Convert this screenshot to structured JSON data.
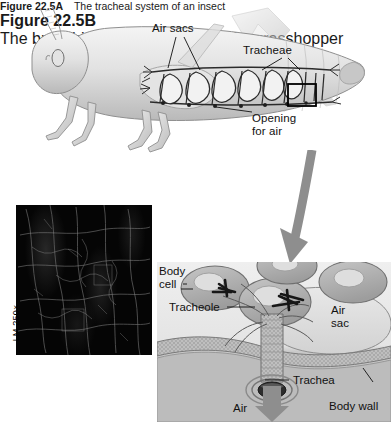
{
  "figure_a": {
    "labels": {
      "air_sacs": "Air sacs",
      "tracheae": "Tracheae",
      "opening_for_air": "Opening\nfor air"
    },
    "caption_title": "Figure 22.5A",
    "caption_text": "The tracheal system of an insect"
  },
  "figure_b": {
    "magnification": "LM 250×",
    "caption_title": "Figure 22.5B",
    "caption_text": "The branching tracheal\nsystem of a grasshopper"
  },
  "figure_c": {
    "labels": {
      "body_cell": "Body\ncell",
      "tracheole": "Tracheole",
      "air_sac": "Air\nsac",
      "trachea": "Trachea",
      "body_wall": "Body wall",
      "air": "Air"
    }
  },
  "colors": {
    "ink": "#111111",
    "body_light": "#e9e9e9",
    "body_mid": "#c9c9c9",
    "body_dark": "#9a9a9a",
    "arrow_gray": "#8e8e8e",
    "micrograph_bg": "#050505",
    "cell_fill": "#b0b0b0",
    "airsac_fill": "#dcdcdc",
    "wall_fill": "#c0c0c0"
  }
}
